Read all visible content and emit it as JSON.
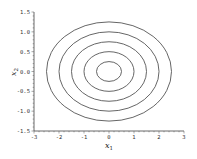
{
  "chart_data": {
    "type": "contour",
    "title": "",
    "xlabel": "x1",
    "ylabel": "x2",
    "xlim": [
      -3,
      3
    ],
    "ylim": [
      -1.5,
      1.5
    ],
    "x_ticks": [
      "-3",
      "-2",
      "-1",
      "0",
      "1",
      "2",
      "3"
    ],
    "y_ticks": [
      "-1.5",
      "-1.0",
      "-0.5",
      "0.0",
      "0.5",
      "1.0",
      "1.5"
    ],
    "grid": false,
    "legend": null,
    "function_hint": "x1^2/4 + x2^2 = c",
    "center": [
      0,
      0
    ],
    "contours": [
      {
        "level": 1,
        "rx": 0.5,
        "ry": 0.25
      },
      {
        "level": 2,
        "rx": 1.0,
        "ry": 0.5
      },
      {
        "level": 3,
        "rx": 1.5,
        "ry": 0.75
      },
      {
        "level": 4,
        "rx": 2.0,
        "ry": 1.0
      },
      {
        "level": 5,
        "rx": 2.5,
        "ry": 1.25
      }
    ],
    "line_color": "#555555"
  },
  "axes": {
    "xlabel_main": "x",
    "xlabel_sub": "1",
    "ylabel_main": "x",
    "ylabel_sub": "2"
  }
}
